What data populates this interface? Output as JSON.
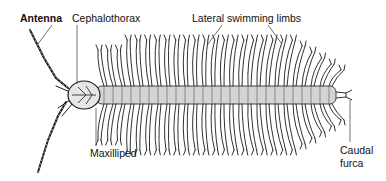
{
  "diagram": {
    "labels": {
      "antenna": "Antenna",
      "cephalothorax": "Cephalothorax",
      "lateral_limbs": "Lateral swimming limbs",
      "maxilliped": "Maxilliped",
      "caudal_line1": "Caudal",
      "caudal_line2": "furca"
    },
    "colors": {
      "ink": "#1a1a1a",
      "body_shade": "#cfcfcf",
      "background": "#ffffff"
    }
  }
}
